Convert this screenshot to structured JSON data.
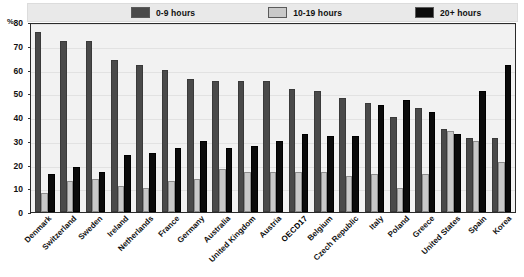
{
  "title_partial": "",
  "axis": {
    "y_unit": "%",
    "y_ticks": [
      "80",
      "70",
      "60",
      "50",
      "40",
      "30",
      "20",
      "10",
      "0"
    ],
    "y_min": 0,
    "y_max": 80
  },
  "legend": {
    "items": [
      {
        "label": "0-9 hours",
        "color": "#4a4a4a",
        "icon": "legend-swatch-dark-gray"
      },
      {
        "label": "10-19 hours",
        "color": "#c9c9c9",
        "icon": "legend-swatch-light-gray"
      },
      {
        "label": "20+ hours",
        "color": "#0b0b0b",
        "icon": "legend-swatch-black"
      }
    ]
  },
  "chart_data": {
    "type": "bar",
    "title": "",
    "xlabel": "",
    "ylabel": "%",
    "ylim": [
      0,
      80
    ],
    "grid": true,
    "legend_position": "top",
    "categories": [
      "Denmark",
      "Switzerland",
      "Sweden",
      "Ireland",
      "Netherlands",
      "France",
      "Germany",
      "Australia",
      "United Kingdom",
      "Austria",
      "OECD17",
      "Belgium",
      "Czech Republic",
      "Italy",
      "Poland",
      "Greece",
      "United States",
      "Spain",
      "Korea"
    ],
    "highlight_category": "OECD17",
    "series": [
      {
        "name": "0-9 hours",
        "color": "#4a4a4a",
        "values": [
          76,
          72,
          72,
          64,
          62,
          60,
          56,
          55,
          55,
          55,
          52,
          51,
          48,
          46,
          40,
          44,
          35,
          31,
          31
        ]
      },
      {
        "name": "10-19 hours",
        "color": "#c9c9c9",
        "values": [
          8,
          13,
          14,
          11,
          10,
          13,
          14,
          18,
          17,
          17,
          17,
          17,
          15,
          16,
          10,
          16,
          34,
          30,
          21
        ]
      },
      {
        "name": "20+ hours",
        "color": "#0b0b0b",
        "values": [
          16,
          19,
          17,
          24,
          25,
          27,
          30,
          27,
          28,
          30,
          33,
          32,
          32,
          45,
          47,
          42,
          33,
          51,
          62
        ]
      }
    ]
  }
}
